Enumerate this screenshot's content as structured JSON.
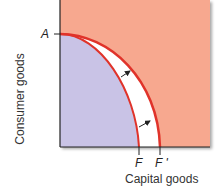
{
  "diagram": {
    "y_axis_label": "Consumer goods",
    "x_axis_label": "Capital goods",
    "point_a": "A",
    "curve_original": "F",
    "curve_shifted": "F '",
    "colors": {
      "background_region": "#f7a88f",
      "inside_region": "#c9c3e6",
      "gap_region": "#ffffff",
      "frontier_line": "#e0332a",
      "axis": "#222222"
    },
    "arrows": 2
  }
}
